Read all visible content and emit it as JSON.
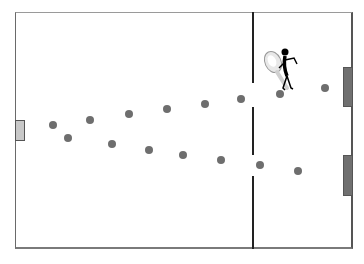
{
  "field": {
    "background": "#ffffff",
    "border_color": "#6a6a6a",
    "center_line_x": 253,
    "center_line_segments": [
      [
        12,
        83
      ],
      [
        107,
        155
      ],
      [
        176,
        249
      ]
    ]
  },
  "goals": [
    {
      "side": "left",
      "x": 15,
      "y": 120,
      "w": 10,
      "h": 21,
      "color": "#c8c8c8"
    },
    {
      "side": "right-top",
      "x": 343,
      "y": 67,
      "w": 10,
      "h": 40,
      "color": "#707070"
    },
    {
      "side": "right-bottom",
      "x": 343,
      "y": 155,
      "w": 10,
      "h": 41,
      "color": "#707070"
    }
  ],
  "dots_color": "#6e6e6e",
  "dots": [
    {
      "x": 53,
      "y": 125
    },
    {
      "x": 90,
      "y": 120
    },
    {
      "x": 129,
      "y": 114
    },
    {
      "x": 167,
      "y": 109
    },
    {
      "x": 205,
      "y": 104
    },
    {
      "x": 241,
      "y": 99
    },
    {
      "x": 280,
      "y": 94
    },
    {
      "x": 325,
      "y": 88
    },
    {
      "x": 68,
      "y": 138
    },
    {
      "x": 112,
      "y": 144
    },
    {
      "x": 149,
      "y": 150
    },
    {
      "x": 183,
      "y": 155
    },
    {
      "x": 221,
      "y": 160
    },
    {
      "x": 260,
      "y": 165
    },
    {
      "x": 298,
      "y": 171
    }
  ],
  "player": {
    "icon": "stick-figure-with-racket-icon",
    "x": 261,
    "y": 48
  }
}
